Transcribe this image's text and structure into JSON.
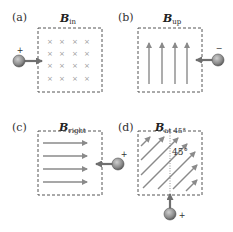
{
  "panels": [
    {
      "id": "a",
      "label": "(a)",
      "field_symbol": "B",
      "field_subscript": "in",
      "charge_sign": "+",
      "field_direction": "into page"
    },
    {
      "id": "b",
      "label": "(b)",
      "field_symbol": "B",
      "field_subscript": "up",
      "charge_sign": "−",
      "field_direction": "up"
    },
    {
      "id": "c",
      "label": "(c)",
      "field_symbol": "B",
      "field_subscript": "right",
      "charge_sign": "+",
      "field_direction": "right"
    },
    {
      "id": "d",
      "label": "(d)",
      "field_symbol": "B",
      "field_subscript": "at 45°",
      "charge_sign": "+",
      "field_direction": "45 degrees",
      "angle_label": "45°"
    }
  ],
  "colors": {
    "arrow": "#8a8a8a",
    "border": "#555555",
    "charge": "#8f8f8f",
    "text": "#222222"
  }
}
